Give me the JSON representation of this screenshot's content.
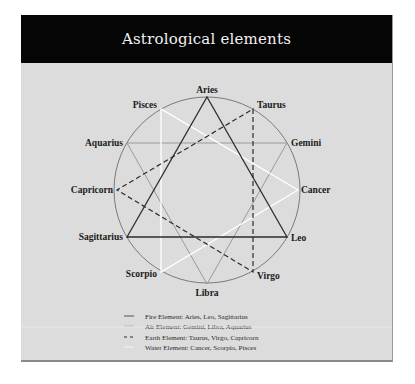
{
  "title": "Astrological elements",
  "colors": {
    "header_bg": "#050505",
    "panel_bg": "#dcdcdc",
    "fire": "#2b2b2b",
    "air": "#9a9a9a",
    "earth": "#2b2b2b",
    "water": "#ffffff",
    "circle": "#7a7a7a"
  },
  "signs": {
    "aries": "Aries",
    "taurus": "Taurus",
    "gemini": "Gemini",
    "cancer": "Cancer",
    "leo": "Leo",
    "virgo": "Virgo",
    "libra": "Libra",
    "scorpio": "Scorpio",
    "sagittarius": "Sagittarius",
    "capricorn": "Capricorn",
    "aquarius": "Aquarius",
    "pisces": "Pisces"
  },
  "legend": [
    {
      "style": "solid-dark",
      "label": "Fire Element: Aries, Leo, Sagittarius"
    },
    {
      "style": "solid-gray",
      "label": "Air Element: Gemini, Libra, Aquarius"
    },
    {
      "style": "dashed-dark",
      "label": "Earth Element: Taurus, Virgo, Capricorn"
    },
    {
      "style": "solid-white",
      "label": "Water Element: Cancer, Scorpio, Pisces"
    }
  ]
}
